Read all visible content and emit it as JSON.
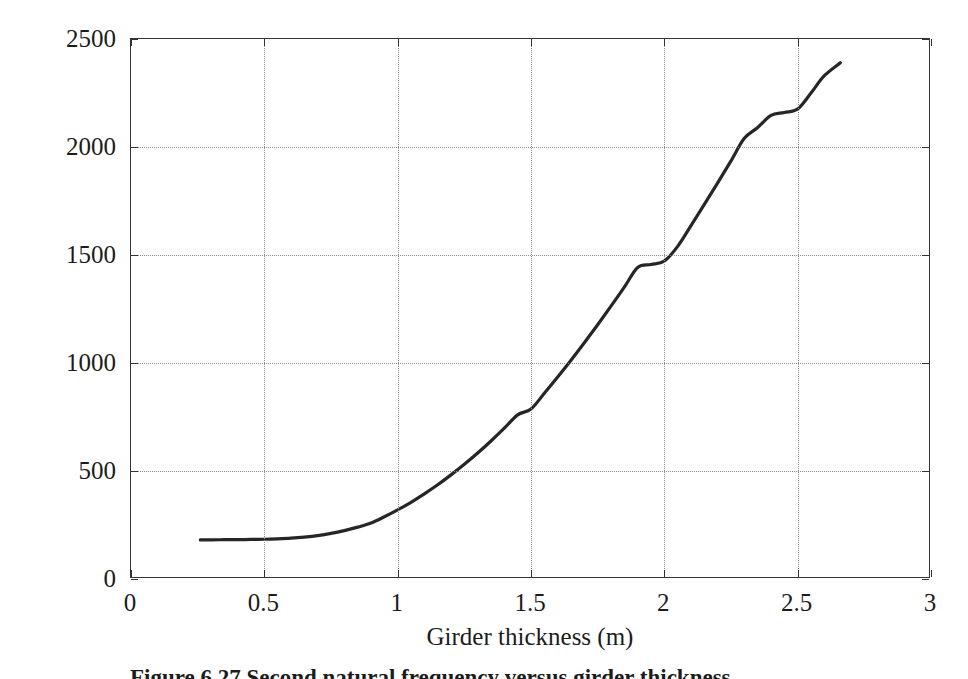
{
  "figure": {
    "kind": "line-plot",
    "background_color": "#ffffff",
    "axis_color": "#333333",
    "grid_color": "#8c8c8c",
    "curve_color": "#262626"
  },
  "caption": {
    "text": "Figure 6.27  Second natural frequency versus girder thickness"
  },
  "chart_data": {
    "type": "line",
    "title": "",
    "subtitle": "",
    "xlabel": "Girder thickness (m)",
    "ylabel": "Second natural frequency (r/s)",
    "xlim": [
      0,
      3
    ],
    "ylim": [
      0,
      2500
    ],
    "xticks": [
      0,
      0.5,
      1,
      1.5,
      2,
      2.5,
      3
    ],
    "xticklabels": [
      "0",
      "0.5",
      "1",
      "1.5",
      "2",
      "2.5",
      "3"
    ],
    "yticks": [
      0,
      500,
      1000,
      1500,
      2000,
      2500
    ],
    "yticklabels": [
      "0",
      "500",
      "1000",
      "1500",
      "2000",
      "2500"
    ],
    "grid": true,
    "grid_style": "dotted",
    "legend": null,
    "legend_position": "none",
    "annotations": [],
    "series": [
      {
        "name": "Second natural frequency",
        "color": "#262626",
        "linewidth": 3.2,
        "x": [
          0.26,
          0.3,
          0.35,
          0.4,
          0.45,
          0.5,
          0.55,
          0.6,
          0.65,
          0.7,
          0.75,
          0.8,
          0.85,
          0.9,
          0.95,
          1.0,
          1.05,
          1.1,
          1.15,
          1.2,
          1.25,
          1.3,
          1.35,
          1.4,
          1.45,
          1.5,
          1.55,
          1.6,
          1.65,
          1.7,
          1.75,
          1.8,
          1.85,
          1.9,
          1.95,
          2.0,
          2.05,
          2.1,
          2.15,
          2.2,
          2.25,
          2.3,
          2.35,
          2.4,
          2.45,
          2.5,
          2.55,
          2.6,
          2.66
        ],
        "y": [
          181,
          181,
          182,
          182,
          183,
          184,
          186,
          189,
          194,
          201,
          211,
          224,
          240,
          259,
          288,
          320,
          355,
          394,
          436,
          482,
          531,
          583,
          639,
          698,
          760,
          787,
          860,
          935,
          1013,
          1094,
          1177,
          1263,
          1351,
          1442,
          1456,
          1472,
          1540,
          1636,
          1734,
          1834,
          1936,
          2040,
          2090,
          2146,
          2160,
          2176,
          2250,
          2330,
          2390
        ]
      }
    ]
  }
}
